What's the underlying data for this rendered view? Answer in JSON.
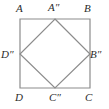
{
  "figure": {
    "kind": "geometry-diagram",
    "background_color": "#ffffff",
    "outer_square": {
      "name": "outer-square-ABCD",
      "stroke_color": "#8c8c8c",
      "stroke_width": 1.2,
      "fill": "none",
      "vertices": [
        {
          "label": "A",
          "role": "top-left",
          "x": 20,
          "y": 19
        },
        {
          "label": "B",
          "role": "top-right",
          "x": 90,
          "y": 19
        },
        {
          "label": "C",
          "role": "bottom-right",
          "x": 90,
          "y": 88
        },
        {
          "label": "D",
          "role": "bottom-left",
          "x": 20,
          "y": 88
        }
      ]
    },
    "inner_square": {
      "name": "inner-square-A2B2C2D2",
      "stroke_color": "#8c8c8c",
      "stroke_width": 1.2,
      "fill": "none",
      "vertices": [
        {
          "label": "A″",
          "role": "top-midpoint",
          "x": 55,
          "y": 19
        },
        {
          "label": "B″",
          "role": "right-midpoint",
          "x": 90,
          "y": 54
        },
        {
          "label": "C″",
          "role": "bottom-midpoint",
          "x": 55,
          "y": 88
        },
        {
          "label": "D″",
          "role": "left-midpoint",
          "x": 20,
          "y": 54
        }
      ]
    },
    "labels": {
      "A": "A",
      "B": "B",
      "C": "C",
      "D": "D",
      "A_double_prime": "A″",
      "B_double_prime": "B″",
      "C_double_prime": "C″",
      "D_double_prime": "D″"
    },
    "label_color": "#2b2b2b"
  }
}
